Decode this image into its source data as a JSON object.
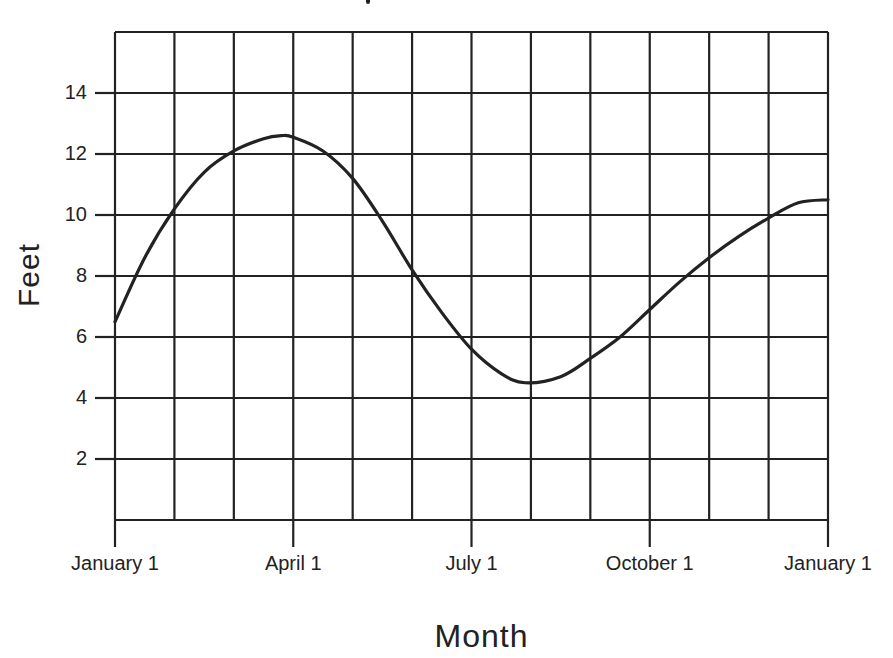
{
  "chart_data": {
    "type": "line",
    "title": "",
    "xlabel": "Month",
    "ylabel": "Feet",
    "x_tick_labels": [
      "January 1",
      "April 1",
      "July 1",
      "October 1",
      "January 1"
    ],
    "y_tick_labels": [
      "2",
      "4",
      "6",
      "8",
      "10",
      "12",
      "14"
    ],
    "ylim": [
      0,
      16
    ],
    "xlim_months": [
      0,
      12
    ],
    "grid": true,
    "legend": null,
    "series": [
      {
        "name": "Feet",
        "x_months": [
          0,
          0.5,
          1,
          1.5,
          2,
          2.5,
          2.8,
          3,
          3.5,
          4,
          4.5,
          5,
          5.5,
          6,
          6.5,
          6.9,
          7.5,
          8,
          8.5,
          9,
          9.5,
          10,
          10.5,
          11,
          11.5,
          12
        ],
        "values": [
          6.5,
          8.6,
          10.2,
          11.4,
          12.1,
          12.5,
          12.6,
          12.55,
          12.1,
          11.2,
          9.8,
          8.2,
          6.8,
          5.6,
          4.8,
          4.5,
          4.7,
          5.3,
          6.0,
          6.9,
          7.8,
          8.6,
          9.3,
          9.9,
          10.4,
          10.5
        ]
      }
    ]
  }
}
